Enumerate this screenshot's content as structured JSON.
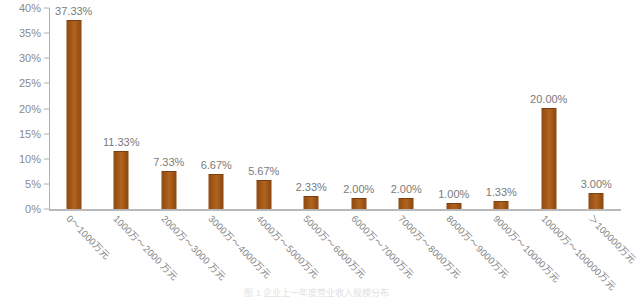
{
  "chart_data": {
    "type": "bar",
    "title": "",
    "xlabel": "",
    "ylabel": "",
    "ylim": [
      0,
      40
    ],
    "ytick_labels": [
      "0%",
      "5%",
      "10%",
      "15%",
      "20%",
      "25%",
      "30%",
      "35%",
      "40%"
    ],
    "ytick_values": [
      0,
      5,
      10,
      15,
      20,
      25,
      30,
      35,
      40
    ],
    "grid": false,
    "legend": "none",
    "bar_color": "#a25716",
    "categories": [
      "0～1000万元",
      "1000万～2000 万元",
      "2000万～3000 万元",
      "3000万～4000万元",
      "4000万～5000万元",
      "5000万～6000万元",
      "6000万～7000万元",
      "7000万～8000万元",
      "8000万～9000万元",
      "9000万～10000万元",
      "10000万～100000万元",
      "＞100000万元"
    ],
    "values": [
      37.33,
      11.33,
      7.33,
      6.67,
      5.67,
      2.33,
      2.0,
      2.0,
      1.0,
      1.33,
      20.0,
      3.0
    ],
    "value_labels": [
      "37.33%",
      "11.33%",
      "7.33%",
      "6.67%",
      "5.67%",
      "2.33%",
      "2.00%",
      "2.00%",
      "1.00%",
      "1.33%",
      "20.00%",
      "3.00%"
    ]
  },
  "caption": {
    "text": "图 1  企业上一年度营业收入规模分布"
  }
}
